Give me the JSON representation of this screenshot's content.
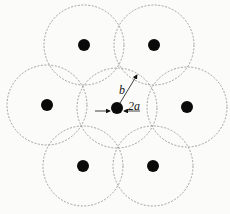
{
  "diagram": {
    "type": "hexagonal fiber array with overlapping circles",
    "labels": {
      "radius": "b",
      "diameter": "2a"
    },
    "circle_radius_px": 40,
    "colors": {
      "dot": "#0a0a0a",
      "circle": "#8a8a8a",
      "background": "#fbfbf9"
    },
    "nodes": [
      {
        "id": "center",
        "x": 117,
        "y": 108
      },
      {
        "id": "top-left",
        "x": 84,
        "y": 45
      },
      {
        "id": "top-right",
        "x": 154,
        "y": 45
      },
      {
        "id": "left",
        "x": 47,
        "y": 105
      },
      {
        "id": "right",
        "x": 187,
        "y": 107
      },
      {
        "id": "bottom-left",
        "x": 83,
        "y": 166
      },
      {
        "id": "bottom-right",
        "x": 153,
        "y": 166
      }
    ]
  }
}
